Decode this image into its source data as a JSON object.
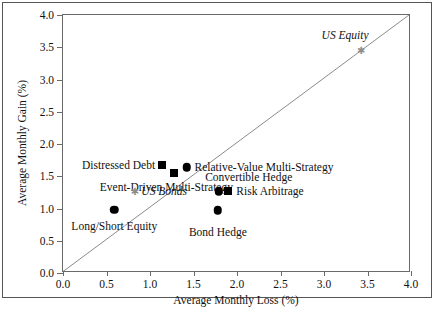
{
  "chart_data": {
    "type": "scatter",
    "title": "",
    "xlabel": "Average Monthly Loss (%)",
    "ylabel": "Average Monthly Gain (%)",
    "xlim": [
      0.0,
      4.0
    ],
    "ylim": [
      0.0,
      4.0
    ],
    "grid": false,
    "legend": "none",
    "reference_line": {
      "name": "forty-five-degree-line",
      "description": "y = x diagonal",
      "from": [
        0.0,
        0.0
      ],
      "to": [
        4.0,
        4.0
      ]
    },
    "xticks": [
      "0.0",
      "0.5",
      "1.0",
      "1.5",
      "2.0",
      "2.5",
      "3.0",
      "3.5",
      "4.0"
    ],
    "yticks": [
      "0.0",
      "0.5",
      "1.0",
      "1.5",
      "2.0",
      "2.5",
      "3.0",
      "3.5",
      "4.0"
    ],
    "xtick_values": [
      0.0,
      0.5,
      1.0,
      1.5,
      2.0,
      2.5,
      3.0,
      3.5,
      4.0
    ],
    "ytick_values": [
      0.0,
      0.5,
      1.0,
      1.5,
      2.0,
      2.5,
      3.0,
      3.5,
      4.0
    ],
    "points": [
      {
        "label": "Distressed Debt",
        "x": 1.14,
        "y": 1.68,
        "marker": "square",
        "color": "#000000",
        "italic": false,
        "label_align": "left",
        "label_dx": -7,
        "label_dy": 0
      },
      {
        "label": "Event-Driven Multi-Strategy",
        "x": 1.28,
        "y": 1.55,
        "marker": "square",
        "color": "#000000",
        "italic": false,
        "label_align": "center",
        "label_dx": -8,
        "label_dy": 14
      },
      {
        "label": "Relative-Value Multi-Strategy",
        "x": 1.42,
        "y": 1.64,
        "marker": "circle",
        "color": "#000000",
        "italic": false,
        "label_align": "right",
        "label_dx": 8,
        "label_dy": 0
      },
      {
        "label": "US Bonds",
        "x": 0.82,
        "y": 1.27,
        "marker": "asterisk",
        "color": "#8d8d8d",
        "italic": true,
        "label_align": "right",
        "label_dx": 7,
        "label_dy": 0
      },
      {
        "label": "Convertible Hedge",
        "x": 1.79,
        "y": 1.27,
        "marker": "circle",
        "color": "#000000",
        "italic": false,
        "label_align": "center",
        "label_dx": 30,
        "label_dy": -14
      },
      {
        "label": "Risk Arbitrage",
        "x": 1.9,
        "y": 1.27,
        "marker": "square",
        "color": "#000000",
        "italic": false,
        "label_align": "right",
        "label_dx": 8,
        "label_dy": 0
      },
      {
        "label": "Long/Short Equity",
        "x": 0.59,
        "y": 0.98,
        "marker": "circle",
        "color": "#000000",
        "italic": false,
        "label_align": "center",
        "label_dx": 0,
        "label_dy": 16
      },
      {
        "label": "Bond Hedge",
        "x": 1.78,
        "y": 0.97,
        "marker": "circle",
        "color": "#000000",
        "italic": false,
        "label_align": "center",
        "label_dx": 0,
        "label_dy": 22
      },
      {
        "label": "US Equity",
        "x": 3.42,
        "y": 3.46,
        "marker": "asterisk",
        "color": "#8d8d8d",
        "italic": true,
        "label_align": "left",
        "label_dx": 8,
        "label_dy": -15
      }
    ]
  },
  "scan": {
    "caption_fragment": ""
  },
  "style": {
    "marker_color": "#000000",
    "benchmark_color": "#8d8d8d",
    "axis_color": "#6a6a6a",
    "text_color": "#111111",
    "frame_color": "#555555"
  }
}
